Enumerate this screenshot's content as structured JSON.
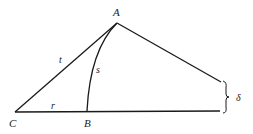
{
  "diagram": {
    "type": "geometry",
    "colors": {
      "stroke": "#1a1a1a",
      "background": "#ffffff"
    },
    "points": [
      {
        "id": "A",
        "label": "A",
        "x": 117,
        "y": 23
      },
      {
        "id": "B",
        "label": "B",
        "x": 87,
        "y": 111
      },
      {
        "id": "C",
        "label": "C",
        "x": 15,
        "y": 112
      }
    ],
    "segment_labels": {
      "t": "t",
      "s": "s",
      "r": "r",
      "delta": "δ"
    }
  }
}
